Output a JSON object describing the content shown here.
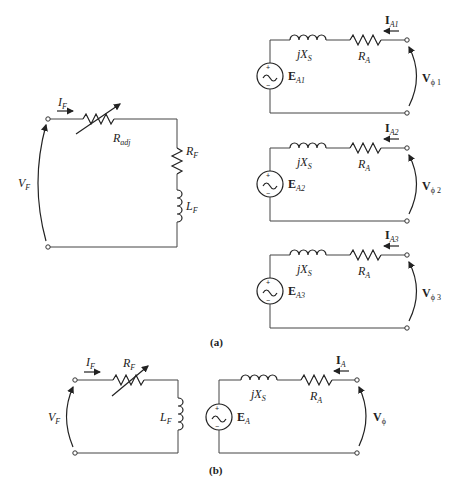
{
  "figure_a": {
    "caption": "(a)",
    "field_circuit": {
      "current_label": "I",
      "current_sub": "F",
      "voltage_label": "V",
      "voltage_sub": "F",
      "radj_label": "R",
      "radj_sub": "adj",
      "rf_label": "R",
      "rf_sub": "F",
      "lf_label": "L",
      "lf_sub": "F"
    },
    "armature_circuits": [
      {
        "source_label": "E",
        "source_sub": "A1",
        "current_label": "I",
        "current_sub": "A1",
        "voltage_label": "V",
        "voltage_sub": "ϕ 1",
        "reactance_label": "jX",
        "reactance_sub": "S",
        "resistance_label": "R",
        "resistance_sub": "A"
      },
      {
        "source_label": "E",
        "source_sub": "A2",
        "current_label": "I",
        "current_sub": "A2",
        "voltage_label": "V",
        "voltage_sub": "ϕ 2",
        "reactance_label": "jX",
        "reactance_sub": "S",
        "resistance_label": "R",
        "resistance_sub": "A"
      },
      {
        "source_label": "E",
        "source_sub": "A3",
        "current_label": "I",
        "current_sub": "A3",
        "voltage_label": "V",
        "voltage_sub": "ϕ 3",
        "reactance_label": "jX",
        "reactance_sub": "S",
        "resistance_label": "R",
        "resistance_sub": "A"
      }
    ]
  },
  "figure_b": {
    "caption": "(b)",
    "field_circuit": {
      "current_label": "I",
      "current_sub": "F",
      "voltage_label": "V",
      "voltage_sub": "F",
      "rf_label": "R",
      "rf_sub": "F",
      "lf_label": "L",
      "lf_sub": "F"
    },
    "armature_circuit": {
      "source_label": "E",
      "source_sub": "A",
      "current_label": "I",
      "current_sub": "A",
      "voltage_label": "V",
      "voltage_sub": "ϕ",
      "reactance_label": "jX",
      "reactance_sub": "S",
      "resistance_label": "R",
      "resistance_sub": "A"
    }
  },
  "source_symbols": {
    "plus": "+",
    "minus": "−"
  }
}
